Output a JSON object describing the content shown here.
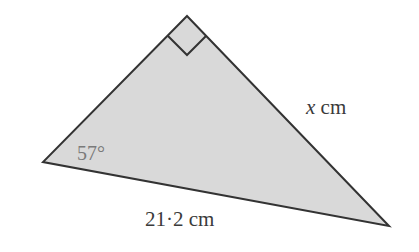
{
  "diagram": {
    "type": "right-triangle",
    "colors": {
      "fill": "#d9d9d9",
      "stroke": "#333333",
      "label": "#3a3a3a",
      "angle_label": "#7a7a7a"
    },
    "vertices": {
      "top_right_angle": [
        187,
        16
      ],
      "left": [
        43,
        162
      ],
      "right": [
        389,
        226
      ]
    },
    "labels": {
      "angle": "57°",
      "side_variable": "x",
      "side_unit": " cm",
      "hypotenuse": "21·2 cm"
    }
  }
}
